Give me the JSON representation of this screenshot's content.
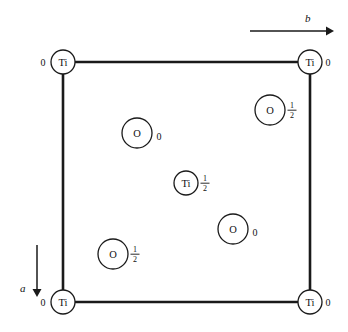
{
  "figure": {
    "kind": "crystal-structure-projection"
  },
  "cell": {
    "left": 63,
    "top": 62,
    "right": 310,
    "bottom": 302,
    "edge_color": "#1a1a1a"
  },
  "axes": [
    {
      "id": "axis-b",
      "label": "b",
      "direction": "right",
      "x1": 250,
      "y1": 31,
      "x2": 332,
      "y2": 31,
      "label_x": 305,
      "label_y": 18
    },
    {
      "id": "axis-a",
      "label": "a",
      "direction": "down",
      "x1": 37,
      "y1": 245,
      "x2": 37,
      "y2": 296,
      "label_x": 24,
      "label_y": 288
    }
  ],
  "atoms": [
    {
      "id": "ti-top-left",
      "element": "Ti",
      "cx": 63,
      "cy": 62,
      "r": 12,
      "occupancy": "0",
      "frac": false,
      "label_side": "left",
      "label_x": 43,
      "label_y": 62
    },
    {
      "id": "ti-top-right",
      "element": "Ti",
      "cx": 310,
      "cy": 62,
      "r": 12,
      "occupancy": "0",
      "frac": false,
      "label_side": "right",
      "label_x": 327,
      "label_y": 62
    },
    {
      "id": "ti-bottom-left",
      "element": "Ti",
      "cx": 63,
      "cy": 302,
      "r": 12,
      "occupancy": "0",
      "frac": false,
      "label_side": "left",
      "label_x": 43,
      "label_y": 302
    },
    {
      "id": "ti-bottom-right",
      "element": "Ti",
      "cx": 310,
      "cy": 302,
      "r": 12,
      "occupancy": "0",
      "frac": false,
      "label_side": "right",
      "label_x": 327,
      "label_y": 302
    },
    {
      "id": "ti-center",
      "element": "Ti",
      "cx": 186,
      "cy": 183,
      "r": 12,
      "occupancy": "1/2",
      "frac": true,
      "label_side": "right",
      "label_x": 205,
      "label_y": 183
    },
    {
      "id": "o-upper-left",
      "element": "O",
      "cx": 137,
      "cy": 133,
      "r": 15,
      "occupancy": "0",
      "frac": false,
      "label_side": "right",
      "label_x": 159,
      "label_y": 136
    },
    {
      "id": "o-upper-right",
      "element": "O",
      "cx": 270,
      "cy": 110,
      "r": 15,
      "occupancy": "1/2",
      "frac": true,
      "label_side": "right",
      "label_x": 292,
      "label_y": 112
    },
    {
      "id": "o-lower-right",
      "element": "O",
      "cx": 233,
      "cy": 229,
      "r": 15,
      "occupancy": "0",
      "frac": false,
      "label_side": "right",
      "label_x": 255,
      "label_y": 232
    },
    {
      "id": "o-lower-left",
      "element": "O",
      "cx": 113,
      "cy": 254,
      "r": 15,
      "occupancy": "1/2",
      "frac": true,
      "label_side": "right",
      "label_x": 135,
      "label_y": 256
    }
  ],
  "fraction_parts": {
    "numerator": "1",
    "denominator": "2"
  }
}
